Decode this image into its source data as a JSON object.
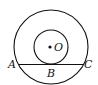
{
  "diagram": {
    "type": "concentric-circles-tangent-chord",
    "stroke_color": "#111111",
    "center": {
      "label": "O",
      "x": 51,
      "y": 47
    },
    "outer_circle": {
      "cx": 51,
      "cy": 47,
      "r": 37
    },
    "inner_circle": {
      "cx": 51,
      "cy": 47,
      "r": 17
    },
    "chord": {
      "x1": 19,
      "y1": 64,
      "x2": 83,
      "y2": 64
    },
    "labels": {
      "A": "A",
      "B": "B",
      "C": "C",
      "O": "O"
    }
  }
}
